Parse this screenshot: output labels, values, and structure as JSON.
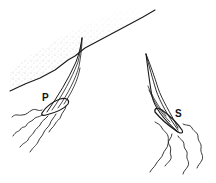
{
  "figure": {
    "colors": {
      "background": "#ffffff",
      "ink": "#1a1a1a",
      "stipple": "#9a9a9a"
    },
    "shore": {
      "label": "shore"
    },
    "boats": [
      {
        "id": "port",
        "label": "P"
      },
      {
        "id": "starboard",
        "label": "S"
      }
    ]
  }
}
